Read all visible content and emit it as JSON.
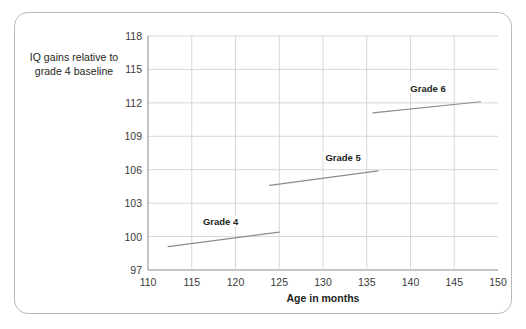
{
  "chart_data": {
    "type": "line",
    "title": "",
    "xlabel": "Age in months",
    "ylabel": "IQ gains relative to grade 4 baseline",
    "xlim": [
      110,
      150
    ],
    "ylim": [
      97,
      118
    ],
    "xticks": [
      110,
      115,
      120,
      125,
      130,
      135,
      140,
      145,
      150
    ],
    "yticks": [
      97,
      100,
      103,
      106,
      109,
      112,
      115,
      118
    ],
    "grid": true,
    "legend": "inline-labels",
    "series": [
      {
        "name": "Grade 4",
        "label": "Grade 4",
        "x": [
          112.3,
          125.0
        ],
        "y": [
          99.1,
          100.4
        ],
        "label_x": 118.3,
        "label_y": 101.4
      },
      {
        "name": "Grade 5",
        "label": "Grade 5",
        "x": [
          123.9,
          136.3
        ],
        "y": [
          104.6,
          105.9
        ],
        "label_x": 132.3,
        "label_y": 107.1
      },
      {
        "name": "Grade 6",
        "label": "Grade 6",
        "x": [
          135.7,
          148.0
        ],
        "y": [
          111.1,
          112.1
        ],
        "label_x": 142.0,
        "label_y": 113.3
      }
    ],
    "colors": {
      "line": "#8c8c8c",
      "grid": "#d7d7d7",
      "axis": "#8a8a8a",
      "text": "#231f20"
    }
  },
  "axes": {
    "y_label_line1": "IQ gains relative to",
    "y_label_line2": "grade 4 baseline",
    "x_label": "Age in months",
    "ytick_labels": [
      "118",
      "115",
      "112",
      "109",
      "106",
      "103",
      "100",
      "97"
    ],
    "xtick_labels": [
      "110",
      "115",
      "120",
      "125",
      "130",
      "135",
      "140",
      "145",
      "150"
    ]
  },
  "series_labels": {
    "grade4": "Grade 4",
    "grade5": "Grade 5",
    "grade6": "Grade 6"
  }
}
